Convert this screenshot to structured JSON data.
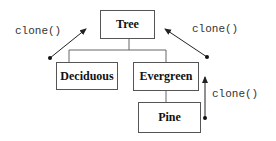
{
  "diagram": {
    "nodes": [
      {
        "id": "tree",
        "label": "Tree"
      },
      {
        "id": "deciduous",
        "label": "Deciduous"
      },
      {
        "id": "evergreen",
        "label": "Evergreen"
      },
      {
        "id": "pine",
        "label": "Pine"
      }
    ],
    "edges": [
      {
        "from": "deciduous",
        "to": "tree",
        "type": "inheritance"
      },
      {
        "from": "evergreen",
        "to": "tree",
        "type": "inheritance"
      },
      {
        "from": "pine",
        "to": "evergreen",
        "type": "inheritance"
      }
    ],
    "annotations": [
      {
        "id": "left",
        "label": "clone()",
        "points_to": "tree"
      },
      {
        "id": "right",
        "label": "clone()",
        "points_to": "tree"
      },
      {
        "id": "pine",
        "label": "clone()",
        "points_to": "evergreen"
      }
    ]
  }
}
